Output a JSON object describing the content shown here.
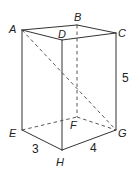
{
  "figure": {
    "type": "rectangular prism (cuboid)",
    "vertices": {
      "A": {
        "label": "A",
        "x": 22,
        "y": 30
      },
      "B": {
        "label": "B",
        "x": 77,
        "y": 25
      },
      "C": {
        "label": "C",
        "x": 116,
        "y": 33
      },
      "D": {
        "label": "D",
        "x": 62,
        "y": 40
      },
      "E": {
        "label": "E",
        "x": 22,
        "y": 130
      },
      "F": {
        "label": "F",
        "x": 77,
        "y": 117
      },
      "G": {
        "label": "G",
        "x": 116,
        "y": 130
      },
      "H": {
        "label": "H",
        "x": 62,
        "y": 150
      }
    },
    "dimensions": {
      "EH": "3",
      "HG": "4",
      "CG": "5"
    },
    "hidden_edges": [
      "BF",
      "EF",
      "FG"
    ],
    "diagonals": [
      "AG"
    ]
  }
}
